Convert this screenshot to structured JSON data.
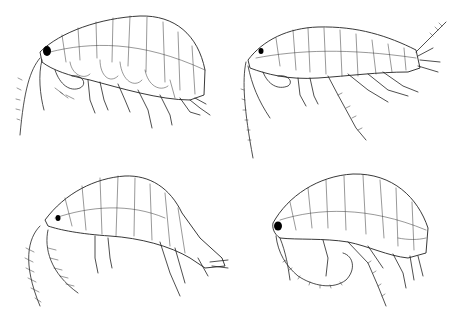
{
  "figure": {
    "background": "#ffffff",
    "line_color": "#222222",
    "panels": [
      {
        "id": "top-left",
        "subject": "amphipod specimen, lateral view, curved body, long antenna descending",
        "position": "top-left"
      },
      {
        "id": "top-right",
        "subject": "amphipod specimen, lateral view, elongated straight body with raised uropods",
        "position": "top-right"
      },
      {
        "id": "bottom-left",
        "subject": "amphipod specimen, lateral view, strongly arched body with setose antennae",
        "position": "bottom-left"
      },
      {
        "id": "bottom-right",
        "subject": "amphipod specimen, lateral view, compact curled body with coiled antenna",
        "position": "bottom-right"
      }
    ]
  }
}
